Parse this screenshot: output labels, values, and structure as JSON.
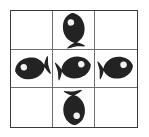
{
  "figure": {
    "grid": {
      "rows": 3,
      "columns": 3,
      "border_color": "#3a3a3a",
      "gridline_color": "#6e6e6e",
      "background_color": "#ffffff"
    },
    "icon": {
      "name": "fish-icon",
      "body_color": "#232323",
      "eye_color": "#f2f2f2"
    },
    "cells": [
      {
        "index": 0,
        "row": 1,
        "column": 1,
        "position": "top-left",
        "occupied": false,
        "content": "",
        "orientation": ""
      },
      {
        "index": 1,
        "row": 1,
        "column": 2,
        "position": "top-center",
        "occupied": true,
        "content": "fish",
        "orientation": "up"
      },
      {
        "index": 2,
        "row": 1,
        "column": 3,
        "position": "top-right",
        "occupied": false,
        "content": "",
        "orientation": ""
      },
      {
        "index": 3,
        "row": 2,
        "column": 1,
        "position": "middle-left",
        "occupied": true,
        "content": "fish",
        "orientation": "left"
      },
      {
        "index": 4,
        "row": 2,
        "column": 2,
        "position": "middle-center",
        "occupied": true,
        "content": "fish",
        "orientation": "right"
      },
      {
        "index": 5,
        "row": 2,
        "column": 3,
        "position": "middle-right",
        "occupied": true,
        "content": "fish",
        "orientation": "right"
      },
      {
        "index": 6,
        "row": 3,
        "column": 1,
        "position": "bottom-left",
        "occupied": false,
        "content": "",
        "orientation": ""
      },
      {
        "index": 7,
        "row": 3,
        "column": 2,
        "position": "bottom-center",
        "occupied": true,
        "content": "fish",
        "orientation": "down"
      },
      {
        "index": 8,
        "row": 3,
        "column": 3,
        "position": "bottom-right",
        "occupied": false,
        "content": "",
        "orientation": ""
      }
    ]
  }
}
